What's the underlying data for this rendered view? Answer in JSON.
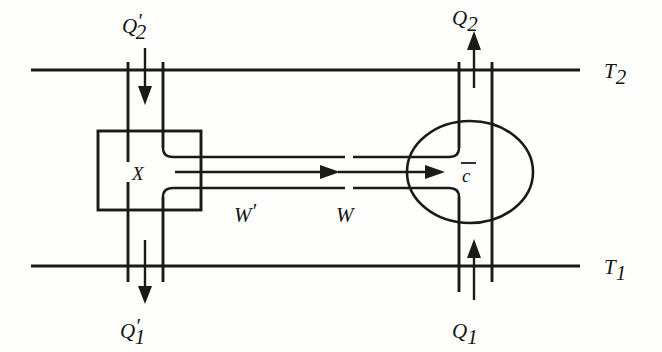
{
  "figure": {
    "type": "schematic-diagram",
    "ink_color": "#1a1a18",
    "background_color": "#fdfdfb"
  },
  "reservoirs": {
    "hot": {
      "label": "T",
      "subscript": "2",
      "label_full": "T2",
      "y": 70
    },
    "cold": {
      "label": "T",
      "subscript": "1",
      "label_full": "T1",
      "y": 265
    }
  },
  "devices": {
    "left": {
      "name": "X",
      "shape": "rectangle",
      "label": "X"
    },
    "right": {
      "name": "C-bar",
      "shape": "ellipse",
      "label": "c",
      "overbar": true,
      "label_full": "C̄"
    }
  },
  "heat_flows": [
    {
      "id": "q2-prime",
      "label": "Q",
      "subscript": "2",
      "prime": "′",
      "label_full": "Q′₂",
      "direction": "down",
      "position": "top-left",
      "reservoir": "T2",
      "device": "X"
    },
    {
      "id": "q1-prime",
      "label": "Q",
      "subscript": "1",
      "prime": "′",
      "label_full": "Q′₁",
      "direction": "down",
      "position": "bottom-left",
      "reservoir": "T1",
      "device": "X"
    },
    {
      "id": "q2",
      "label": "Q",
      "subscript": "2",
      "prime": "",
      "label_full": "Q₂",
      "direction": "up",
      "position": "top-right",
      "reservoir": "T2",
      "device": "C-bar"
    },
    {
      "id": "q1",
      "label": "Q",
      "subscript": "1",
      "prime": "",
      "label_full": "Q₁",
      "direction": "up",
      "position": "bottom-right",
      "reservoir": "T1",
      "device": "C-bar"
    }
  ],
  "work_flows": [
    {
      "id": "w-prime",
      "label": "W",
      "prime": "′",
      "label_full": "W′",
      "direction": "right",
      "source": "X",
      "description": "work output of device X"
    },
    {
      "id": "w",
      "label": "W",
      "prime": "",
      "label_full": "W",
      "direction": "right",
      "target": "C-bar",
      "description": "work input to device C-bar"
    }
  ]
}
